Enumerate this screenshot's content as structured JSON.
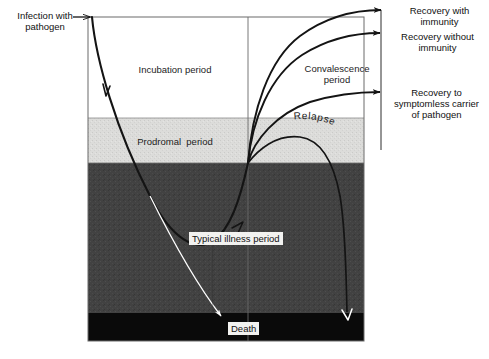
{
  "figure": {
    "background_color": "#ffffff"
  },
  "plot_frame": {
    "left": 88,
    "top": 17,
    "right": 364,
    "bottom": 341,
    "border_color": "#5a5a5a",
    "divider_x": 248
  },
  "bands": [
    {
      "id": "incubation",
      "label": "Incubation period",
      "color": "#ffffff",
      "top": 17,
      "bottom": 118
    },
    {
      "id": "prodromal",
      "label": "Prodromal period",
      "color": "#dededc",
      "top": 118,
      "bottom": 163
    },
    {
      "id": "illness",
      "label": "Typical illness period",
      "color": "#404040",
      "top": 163,
      "bottom": 313
    },
    {
      "id": "death",
      "label": "Death",
      "color": "#0a0a0a",
      "top": 313,
      "bottom": 341
    }
  ],
  "labels": {
    "infection": "Infection with\npathogen",
    "incubation": "Incubation period",
    "prodromal": "Prodromal  period",
    "convalescence": "Convalescence\nperiod",
    "typical_illness": "Typical illness period",
    "death": "Death",
    "relapse": "Relapse",
    "recovery_with_immunity": "Recovery with\nimmunity",
    "recovery_without_immunity": "Recovery without\nimmunity",
    "recovery_carrier": "Recovery to\nsymptomless carrier\nof pathogen"
  },
  "curve_colors": {
    "main": "#141414",
    "thin": "#2a2a2a",
    "white_arrow": "#ffffff"
  },
  "convergence_point": {
    "x": 248,
    "y": 163
  }
}
